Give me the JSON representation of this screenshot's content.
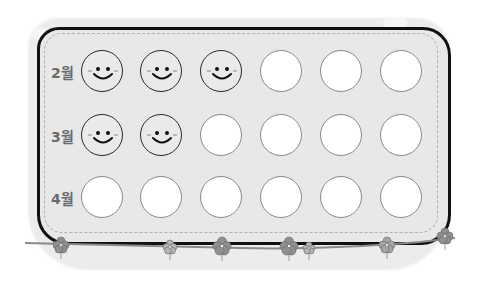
{
  "rows": [
    {
      "label": "2월",
      "slots": [
        "smile",
        "smile",
        "smile",
        "empty",
        "empty",
        "empty"
      ]
    },
    {
      "label": "3월",
      "slots": [
        "smile",
        "smile",
        "empty",
        "empty",
        "empty",
        "empty"
      ]
    },
    {
      "label": "4월",
      "slots": [
        "empty",
        "empty",
        "empty",
        "empty",
        "empty",
        "empty"
      ]
    }
  ],
  "colors": {
    "board": "#e8e8e8",
    "outline": "#111111",
    "stitch": "#b0b0b0",
    "flower": "#888888"
  }
}
